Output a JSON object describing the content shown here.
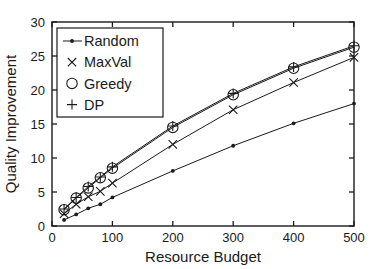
{
  "chart_data": {
    "type": "line",
    "title": "",
    "xlabel": "Resource Budget",
    "ylabel": "Quality Improvement",
    "xlim": [
      0,
      500
    ],
    "ylim": [
      0,
      30
    ],
    "xticks": [
      0,
      100,
      200,
      300,
      400,
      500
    ],
    "yticks": [
      0,
      5,
      10,
      15,
      20,
      25,
      30
    ],
    "xtick_labels": [
      "0",
      "100",
      "200",
      "300",
      "400",
      "500"
    ],
    "ytick_labels": [
      "0",
      "5",
      "10",
      "15",
      "20",
      "25",
      "30"
    ],
    "grid": false,
    "legend_position": "upper left",
    "x": [
      20,
      40,
      60,
      80,
      100,
      200,
      300,
      400,
      500
    ],
    "series": [
      {
        "name": "Random",
        "marker": "dot",
        "values": [
          0.9,
          1.7,
          2.6,
          3.2,
          4.2,
          8.1,
          11.8,
          15.1,
          18.0
        ]
      },
      {
        "name": "MaxVal",
        "marker": "x",
        "values": [
          1.8,
          3.2,
          4.3,
          5.1,
          6.3,
          12.0,
          17.1,
          21.1,
          24.8
        ]
      },
      {
        "name": "Greedy",
        "marker": "circle",
        "values": [
          2.4,
          4.1,
          5.6,
          7.1,
          8.5,
          14.5,
          19.3,
          23.2,
          26.3
        ]
      },
      {
        "name": "DP",
        "marker": "plus",
        "values": [
          2.5,
          4.2,
          5.8,
          7.2,
          8.7,
          14.7,
          19.5,
          23.4,
          26.5
        ]
      }
    ],
    "colors": {
      "axis": "#1a1a1a",
      "series": "#1a1a1a"
    }
  },
  "legend": {
    "items": [
      {
        "label": "Random"
      },
      {
        "label": "MaxVal"
      },
      {
        "label": "Greedy"
      },
      {
        "label": "DP"
      }
    ]
  }
}
